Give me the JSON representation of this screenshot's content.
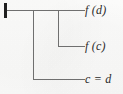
{
  "figure": {
    "kind": "proof-tree-diagram",
    "width": 123,
    "height": 94,
    "background_color": "#fbfbfa",
    "line_color": "#6f6f6f",
    "root_marker_color": "#1f1f1f",
    "text_color": "#2b2b2b"
  },
  "root_marker": {
    "name": "root-tick",
    "x": 5,
    "y_top": 3,
    "y_bottom": 18,
    "thickness": 3
  },
  "branches": [
    {
      "id": "branch-fd",
      "label": "f (d)",
      "trunk_y": 10,
      "stem_x": null,
      "horizontal_from_x": 5,
      "horizontal_to_x": 85,
      "label_x": 85,
      "label_y": 4
    },
    {
      "id": "branch-fc",
      "label": "f (c)",
      "trunk_y": 10,
      "stem_x": 58,
      "stem_to_y": 46,
      "horizontal_from_x": 58,
      "horizontal_to_x": 85,
      "label_x": 85,
      "label_y": 40
    },
    {
      "id": "branch-cd",
      "label": "c = d",
      "trunk_y": 10,
      "stem_x": 33,
      "stem_to_y": 79,
      "horizontal_from_x": 33,
      "horizontal_to_x": 85,
      "label_x": 85,
      "label_y": 73
    }
  ],
  "labels": {
    "top": "f (d)",
    "middle": "f (c)",
    "bottom": "c = d"
  }
}
